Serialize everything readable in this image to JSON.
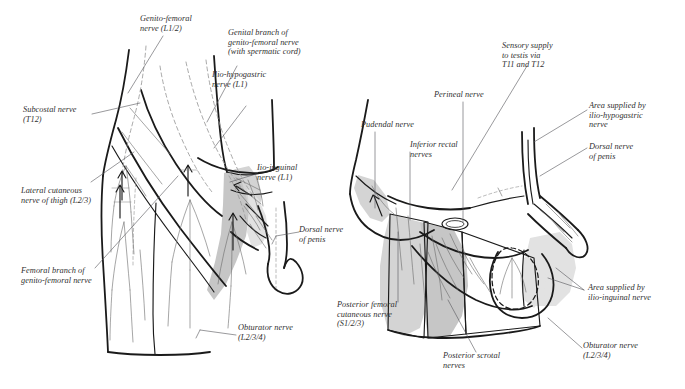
{
  "figure": {
    "type": "anatomical-line-diagram",
    "panels": [
      {
        "id": "left",
        "view": "Anterior view of groin, thigh and external genitalia"
      },
      {
        "id": "right",
        "view": "Inferior (perineal) view of perineum and external genitalia"
      }
    ],
    "colors": {
      "ink": "#1a1a1a",
      "leader": "#55555a",
      "label_text": "#2f2f2f",
      "shade_light": "#e0e0e0",
      "shade_mid": "#d2d2d2",
      "shade_dark": "#c4c4c4",
      "background": "#ffffff"
    }
  },
  "left_panel": {
    "labels": [
      {
        "id": "genito-femoral",
        "text": "Genito-femoral\nnerve (L1/2)"
      },
      {
        "id": "genital-branch",
        "text": "Genital branch of\ngenito-femoral nerve\n(with spermatic cord)"
      },
      {
        "id": "ilio-hypogastric",
        "text": "Ilio-hypogastric\nnerve (L1)"
      },
      {
        "id": "subcostal",
        "text": "Subcostal nerve\n(T12)"
      },
      {
        "id": "ilio-inguinal",
        "text": "Iio-inguinal\nnerve (L1)"
      },
      {
        "id": "lateral-cutaneous-thigh",
        "text": "Lateral cutaneous\nnerve of thigh (L2/3)"
      },
      {
        "id": "dorsal-nerve-penis",
        "text": "Dorsal nerve\nof penis"
      },
      {
        "id": "femoral-branch",
        "text": "Femoral branch of\ngenito-femoral nerve"
      },
      {
        "id": "obturator",
        "text": "Obturator nerve\n(L2/3/4)"
      }
    ]
  },
  "right_panel": {
    "labels": [
      {
        "id": "sensory-testis",
        "text": "Sensory supply\nto testis via\nT11 and T12"
      },
      {
        "id": "perineal",
        "text": "Perineal nerve"
      },
      {
        "id": "area-ilio-hypogastric",
        "text": "Area supplied by\nilio-hypogastric\nnerve"
      },
      {
        "id": "pudendal",
        "text": "Pudendal nerve"
      },
      {
        "id": "inferior-rectal",
        "text": "Inferior rectal\nnerves"
      },
      {
        "id": "dorsal-nerve-penis",
        "text": "Dorsal nerve\nof penis"
      },
      {
        "id": "area-ilio-inguinal",
        "text": "Area supplied by\nilio-inguinal nerve"
      },
      {
        "id": "posterior-femoral-cutaneous",
        "text": "Posterior femoral\ncutaneous nerve\n(S1/2/3)"
      },
      {
        "id": "posterior-scrotal",
        "text": "Posterior scrotal\nnerves"
      },
      {
        "id": "obturator",
        "text": "Obturator nerve\n(L2/3/4)"
      }
    ]
  }
}
